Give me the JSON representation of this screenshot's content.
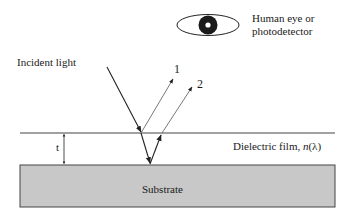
{
  "diagram": {
    "labels": {
      "incident_light": "Incident light",
      "detector_line1": "Human eye or",
      "detector_line2": "photodetector",
      "ray1": "1",
      "ray2": "2",
      "thickness": "t",
      "film_prefix": "Dielectric film, ",
      "film_n": "n",
      "film_suffix": "(λ)",
      "substrate": "Substrate"
    },
    "icons": {
      "detector": "eye-icon"
    },
    "colors": {
      "line": "#222222",
      "ray_reflected": "#555555",
      "substrate_fill": "#c8c8c8",
      "substrate_border": "#444444",
      "eye_pupil": "#1a1a1a"
    }
  }
}
